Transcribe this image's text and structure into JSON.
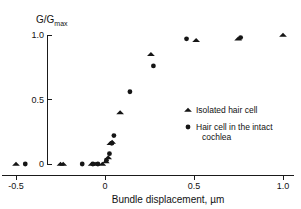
{
  "chart_data": {
    "type": "scatter",
    "title": "",
    "xlabel": "Bundle displacement, µm",
    "ylabel": "G/Gmax",
    "ylabel_main": "G/G",
    "ylabel_subscript": "max",
    "xlim": [
      -0.58,
      1.06
    ],
    "ylim": [
      -0.04,
      1.06
    ],
    "xticks": [
      -0.5,
      0,
      0.5,
      1.0
    ],
    "xticklabels": [
      "-0.5",
      "0",
      "0.5",
      "1.0"
    ],
    "yticks": [
      0,
      0.5,
      1.0
    ],
    "yticklabels": [
      "0",
      "0.5",
      "1.0"
    ],
    "grid": false,
    "legend_position": "center-right",
    "series": [
      {
        "name": "Isolated hair cell",
        "marker": "triangle",
        "color": "#151515",
        "points": [
          [
            -0.5,
            0.0
          ],
          [
            -0.25,
            0.0
          ],
          [
            -0.235,
            0.0
          ],
          [
            -0.075,
            0.0
          ],
          [
            -0.055,
            0.0
          ],
          [
            -0.015,
            0.0
          ],
          [
            0.005,
            0.02
          ],
          [
            0.018,
            0.05
          ],
          [
            0.03,
            0.16
          ],
          [
            0.04,
            0.17
          ],
          [
            0.085,
            0.4
          ],
          [
            0.258,
            0.85
          ],
          [
            0.512,
            0.96
          ],
          [
            0.748,
            0.97
          ],
          [
            1.0,
            1.0
          ]
        ]
      },
      {
        "name": "Hair cell in the intact cochlea",
        "marker": "circle",
        "color": "#151515",
        "points": [
          [
            -0.448,
            0.0
          ],
          [
            -0.128,
            0.0
          ],
          [
            -0.068,
            0.0
          ],
          [
            -0.04,
            0.0
          ],
          [
            0.008,
            0.03
          ],
          [
            0.025,
            0.08
          ],
          [
            0.038,
            0.16
          ],
          [
            0.05,
            0.22
          ],
          [
            0.14,
            0.56
          ],
          [
            0.272,
            0.76
          ],
          [
            0.458,
            0.97
          ],
          [
            0.762,
            0.98
          ]
        ]
      }
    ],
    "legend_entries": [
      {
        "marker": "triangle",
        "label": "Isolated hair cell",
        "label_line2": ""
      },
      {
        "marker": "circle",
        "label": "Hair cell in the intact",
        "label_line2": "cochlea"
      }
    ]
  }
}
